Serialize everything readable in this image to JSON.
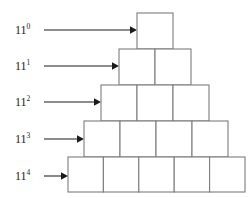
{
  "figure": {
    "type": "staircase-pyramid-diagram",
    "width": 252,
    "height": 198,
    "background_color": "#ffffff",
    "box_stroke_color": "#7d7d7d",
    "box_fill_color": "#ffffff",
    "arrow_color": "#1a1a1a",
    "text_color": "#1a1a1a"
  },
  "rows": [
    {
      "id": "row-0",
      "label_base": "11",
      "label_exponent": "0",
      "label_text": "11",
      "box_count": 1,
      "arrow": {
        "from_x": 44,
        "to_x": 134,
        "y": 30
      },
      "geometry": {
        "x": 137,
        "y": 13,
        "box_size": 36
      }
    },
    {
      "id": "row-1",
      "label_base": "11",
      "label_exponent": "1",
      "label_text": "11",
      "box_count": 2,
      "arrow": {
        "from_x": 44,
        "to_x": 116,
        "y": 66
      },
      "geometry": {
        "x": 119,
        "y": 49,
        "box_size": 36
      }
    },
    {
      "id": "row-2",
      "label_base": "11",
      "label_exponent": "2",
      "label_text": "11",
      "box_count": 3,
      "arrow": {
        "from_x": 44,
        "to_x": 98,
        "y": 102
      },
      "geometry": {
        "x": 101,
        "y": 85,
        "box_size": 36
      }
    },
    {
      "id": "row-3",
      "label_base": "11",
      "label_exponent": "3",
      "label_text": "11",
      "box_count": 4,
      "arrow": {
        "from_x": 44,
        "to_x": 80,
        "y": 139
      },
      "geometry": {
        "x": 84,
        "y": 121,
        "box_size": 36
      }
    },
    {
      "id": "row-4",
      "label_base": "11",
      "label_exponent": "4",
      "label_text": "11",
      "box_count": 5,
      "arrow": {
        "from_x": 44,
        "to_x": 65,
        "y": 176
      },
      "geometry": {
        "x": 68,
        "y": 157,
        "box_size": 35.4
      }
    }
  ],
  "labels_column": {
    "x": 15,
    "entries": [
      {
        "text": "11",
        "exponent": "0",
        "y": 24
      },
      {
        "text": "11",
        "exponent": "1",
        "y": 60
      },
      {
        "text": "11",
        "exponent": "2",
        "y": 96
      },
      {
        "text": "11",
        "exponent": "3",
        "y": 133
      },
      {
        "text": "11",
        "exponent": "4",
        "y": 170
      }
    ]
  }
}
